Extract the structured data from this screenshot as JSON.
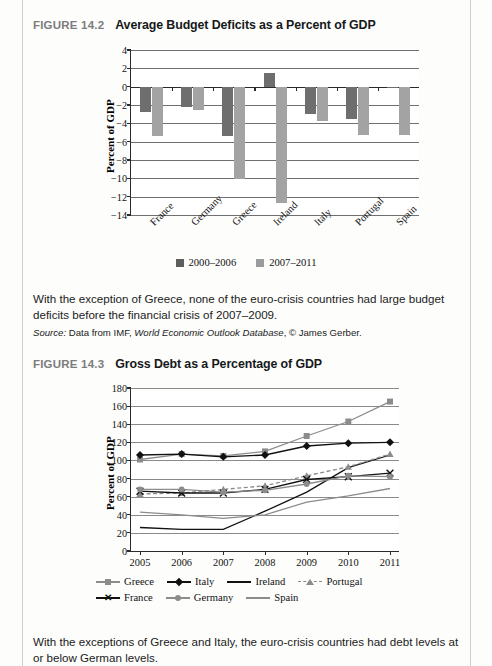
{
  "page": {
    "figure_1": {
      "number": "FIGURE 14.2",
      "title": "Average Budget Deficits as a Percent of GDP",
      "caption": "With the exception of Greece, none of the euro-crisis countries had large budget deficits before the financial crisis of 2007–2009.",
      "source_label": "Source:",
      "source_pre": " Data from IMF, ",
      "source_italic": "World Economic Outlook Database",
      "source_post": ", © James Gerber."
    },
    "figure_2": {
      "number": "FIGURE 14.3",
      "title": "Gross Debt as a Percentage of GDP",
      "caption": "With the exceptions of Greece and Italy, the euro-crisis countries had debt levels at or below German levels."
    }
  },
  "chart_data": [
    {
      "type": "bar",
      "title": "Average Budget Deficits as a Percent of GDP",
      "xlabel": "",
      "ylabel": "Percent of GDP",
      "ylim": [
        -14,
        4
      ],
      "ytick_step": 2,
      "yticks": [
        "4",
        "2",
        "0",
        "-2",
        "-4",
        "-6",
        "-8",
        "-10",
        "-12",
        "-14"
      ],
      "grid": true,
      "legend_position": "bottom",
      "categories": [
        "France",
        "Germany",
        "Greece",
        "Ireland",
        "Italy",
        "Portugal",
        "Spain"
      ],
      "series": [
        {
          "name": "2000–2006",
          "color": "#6e6e6e",
          "values": [
            -2.8,
            -2.2,
            -5.4,
            1.5,
            -3.0,
            -3.5,
            -0.2
          ]
        },
        {
          "name": "2007–2011",
          "color": "#a3a3a3",
          "values": [
            -5.4,
            -2.5,
            -10.1,
            -12.7,
            -3.8,
            -5.3,
            -5.3
          ]
        }
      ]
    },
    {
      "type": "line",
      "title": "Gross Debt as a Percentage of GDP",
      "xlabel": "",
      "ylabel": "Percent of GDP",
      "ylim": [
        0,
        180
      ],
      "ytick_step": 20,
      "yticks": [
        "180",
        "160",
        "140",
        "120",
        "100",
        "80",
        "60",
        "40",
        "20",
        "0"
      ],
      "grid": true,
      "legend_position": "bottom",
      "x": [
        "2005",
        "2006",
        "2007",
        "2008",
        "2009",
        "2010",
        "2011"
      ],
      "series": [
        {
          "name": "Greece",
          "color": "#8c8c8c",
          "marker": "square",
          "dash": false,
          "values": [
            101,
            107,
            105,
            110,
            127,
            143,
            165
          ]
        },
        {
          "name": "Italy",
          "color": "#111111",
          "marker": "diamond",
          "dash": false,
          "values": [
            106,
            107,
            104,
            106,
            116,
            119,
            120
          ]
        },
        {
          "name": "Ireland",
          "color": "#111111",
          "marker": "none",
          "dash": false,
          "values": [
            26,
            24,
            24,
            44,
            65,
            92,
            106
          ]
        },
        {
          "name": "Portugal",
          "color": "#8c8c8c",
          "marker": "triangle",
          "dash": true,
          "values": [
            63,
            64,
            68,
            72,
            83,
            93,
            107
          ]
        },
        {
          "name": "France",
          "color": "#111111",
          "marker": "x",
          "dash": false,
          "values": [
            66,
            64,
            64,
            68,
            79,
            82,
            86
          ]
        },
        {
          "name": "Germany",
          "color": "#8c8c8c",
          "marker": "circle",
          "dash": false,
          "values": [
            68,
            68,
            65,
            67,
            74,
            83,
            82
          ]
        },
        {
          "name": "Spain",
          "color": "#8c8c8c",
          "marker": "none",
          "dash": false,
          "values": [
            43,
            40,
            36,
            40,
            54,
            61,
            69
          ]
        }
      ]
    }
  ]
}
